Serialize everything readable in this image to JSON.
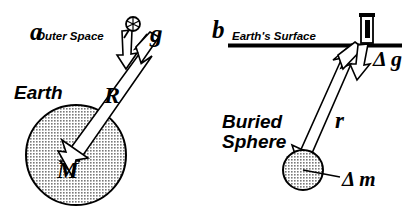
{
  "figure": {
    "width": 405,
    "height": 221,
    "background_color": "#ffffff",
    "ink_color": "#000000",
    "sphere_fill_color": "#b0b0b0"
  },
  "panel_a": {
    "letter": "a",
    "outer_space_label": "Outer Space",
    "earth_label": "Earth",
    "radius_symbol": "R",
    "mass_symbol": "M",
    "gravity_symbol": "g",
    "plumb_icon": "plumb-bob-icon",
    "earth_sphere": {
      "name": "earth-sphere",
      "cx": 76,
      "cy": 155,
      "r": 50,
      "fill": "#b0b0b0"
    },
    "vectors": [
      {
        "name": "radius-vector",
        "label": "R",
        "from": [
          148,
          36
        ],
        "to": [
          72,
          146
        ],
        "style": "hollow-double-shaft"
      },
      {
        "name": "gravity-vector",
        "label": "g",
        "from": [
          129,
          28
        ],
        "to": [
          124,
          70
        ],
        "style": "hollow-short"
      }
    ]
  },
  "panel_b": {
    "letter": "b",
    "surface_label": "Earth's Surface",
    "buried_sphere_label_line1": "Buried",
    "buried_sphere_label_line2": "Sphere",
    "distance_symbol": "r",
    "delta_g_symbol": "Δ g",
    "delta_m_symbol": "Δ m",
    "gravimeter_icon": "gravimeter-icon",
    "surface_line": {
      "name": "earth-surface-line",
      "x1": 228,
      "y1": 45,
      "x2": 401,
      "y2": 45
    },
    "buried_sphere": {
      "name": "buried-sphere",
      "cx": 303,
      "cy": 170,
      "r": 20,
      "fill": "#b0b0b0"
    },
    "vectors": [
      {
        "name": "distance-vector",
        "label": "r",
        "from": [
          350,
          48
        ],
        "to": [
          300,
          166
        ],
        "style": "hollow-double-shaft"
      },
      {
        "name": "delta-g-vector",
        "label": "Δ g",
        "from": [
          363,
          45
        ],
        "to": [
          356,
          78
        ],
        "style": "hollow-short"
      }
    ]
  }
}
